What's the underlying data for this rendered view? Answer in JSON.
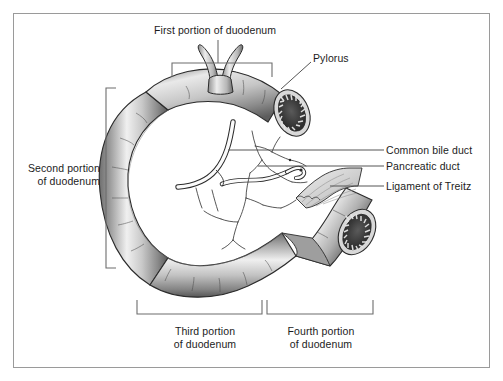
{
  "figure": {
    "border_color": "#9a9a9a",
    "background": "#ffffff",
    "text_color": "#1c1c1c"
  },
  "labels": {
    "first_portion": "First portion of duodenum",
    "pylorus": "Pylorus",
    "second_portion_line1": "Second portion",
    "second_portion_line2": "of duodenum",
    "common_bile_duct": "Common bile duct",
    "pancreatic_duct": "Pancreatic duct",
    "ligament_of_treitz": "Ligament of Treitz",
    "third_portion_line1": "Third portion",
    "third_portion_line2": "of duodenum",
    "fourth_portion_line1": "Fourth portion",
    "fourth_portion_line2": "of duodenum"
  },
  "colors": {
    "bowel_light": "#f2f2f2",
    "bowel_mid": "#b4b4b4",
    "bowel_dark": "#6e6e6e",
    "bowel_shadow": "#4a4a4a",
    "lumen_dark": "#3a3a3a",
    "mucosa_rim": "#e8e8e8",
    "duct_fill": "#fbfbfb",
    "ligament_fill": "#d8d8d8",
    "outline": "#2b2b2b",
    "leader_line": "#444444",
    "bracket": "#6d6d6d"
  }
}
